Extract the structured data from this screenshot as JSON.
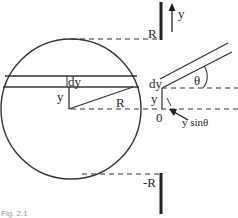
{
  "figure": {
    "caption": "Fig. 2.1",
    "colors": {
      "stroke": "#333333",
      "background": "#ffffff"
    },
    "circle": {
      "labels": {
        "strip_height": "dy",
        "strip_offset": "y",
        "radius": "R"
      }
    },
    "axis": {
      "direction_label": "y",
      "top_label": "R",
      "bottom_label": "-R"
    },
    "inclined_strip": {
      "angle_label": "θ",
      "thickness_label": "dy",
      "offset_label": "y",
      "origin_label": "0",
      "projection_label": "y sinθ"
    }
  }
}
